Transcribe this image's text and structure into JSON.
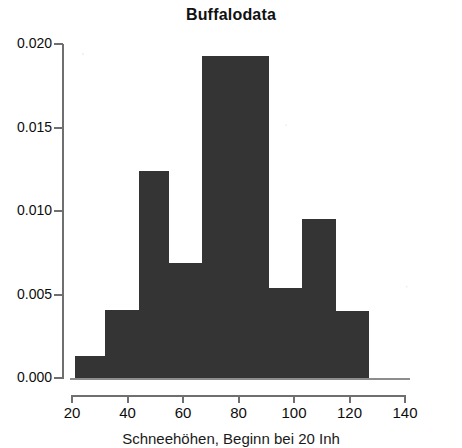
{
  "chart_data": {
    "type": "bar",
    "title": "Buffalodata",
    "xlabel": "Schneehöhen, Beginn bei 20 Inh",
    "ylabel": "",
    "xlim": [
      20,
      140
    ],
    "ylim": [
      0.0,
      0.02
    ],
    "grid": false,
    "legend": null,
    "bin_width": 11.8,
    "x_tick_labels": [
      "20",
      "40",
      "60",
      "80",
      "100",
      "120",
      "140"
    ],
    "x_ticks": [
      20,
      40,
      60,
      80,
      100,
      120,
      140
    ],
    "y_tick_labels": [
      "0.000",
      "0.005",
      "0.010",
      "0.015",
      "0.020"
    ],
    "y_ticks": [
      0.0,
      0.005,
      0.01,
      0.015,
      0.02
    ],
    "bin_edges": [
      21,
      32,
      44,
      55,
      67,
      79,
      91,
      103,
      115,
      127
    ],
    "categories": [
      "21-32",
      "32-44",
      "44-55",
      "55-67",
      "67-79",
      "79-91",
      "91-103",
      "103-115",
      "115-127"
    ],
    "values": [
      0.0013,
      0.0041,
      0.0124,
      0.0069,
      0.0193,
      0.0193,
      0.0054,
      0.0095,
      0.004
    ],
    "bar_color": "#343434",
    "axis_color": "#6f6f6f"
  },
  "figure": {
    "title": "Buffalodata",
    "caption": "Schneehöhen, Beginn bei 20 Inh",
    "background": "#ffffff"
  }
}
